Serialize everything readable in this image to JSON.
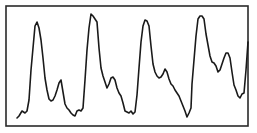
{
  "chart_data": {
    "type": "line",
    "title": "",
    "xlabel": "",
    "ylabel": "",
    "grid": false,
    "legend": null,
    "frame": {
      "x": 6,
      "y": 6,
      "width": 242,
      "height": 120
    },
    "colors": {
      "line": "#1a1a1a",
      "frame": "#2a2a2a",
      "background": "#ffffff"
    },
    "x_pixels": [
      17,
      19,
      22,
      25,
      27,
      29,
      31,
      33,
      35,
      37,
      39,
      41,
      43,
      45,
      47,
      49,
      51,
      53,
      55,
      57,
      59,
      61,
      63,
      65,
      67,
      69,
      71,
      73,
      75,
      77,
      79,
      81,
      83,
      85,
      87,
      89,
      91,
      93,
      95,
      97,
      99,
      101,
      103,
      105,
      107,
      109,
      111,
      113,
      115,
      117,
      119,
      121,
      123,
      125,
      127,
      129,
      131,
      133,
      135,
      137,
      139,
      141,
      143,
      145,
      147,
      149,
      151,
      153,
      155,
      157,
      159,
      161,
      163,
      165,
      167,
      169,
      171,
      173,
      175,
      177,
      179,
      181,
      183,
      185,
      187,
      189,
      191,
      192,
      194,
      196,
      198,
      200,
      202,
      204,
      206,
      208,
      210,
      212,
      214,
      216,
      218,
      220,
      222,
      224,
      226,
      228,
      230,
      232,
      234,
      236,
      238,
      240,
      242,
      244,
      246,
      248
    ],
    "y_pixels": [
      118,
      116,
      111,
      113,
      111,
      100,
      70,
      48,
      26,
      22,
      28,
      40,
      58,
      78,
      90,
      99,
      101,
      100,
      96,
      90,
      83,
      80,
      92,
      104,
      108,
      110,
      113,
      115,
      116,
      111,
      110,
      111,
      108,
      80,
      50,
      28,
      14,
      16,
      19,
      22,
      48,
      68,
      76,
      82,
      88,
      84,
      78,
      77,
      80,
      88,
      93,
      96,
      103,
      111,
      112,
      113,
      111,
      114,
      112,
      95,
      68,
      42,
      26,
      20,
      21,
      26,
      46,
      64,
      72,
      76,
      78,
      77,
      74,
      69,
      72,
      79,
      84,
      86,
      90,
      93,
      96,
      101,
      106,
      111,
      117,
      113,
      108,
      84,
      60,
      36,
      19,
      16,
      16,
      19,
      34,
      45,
      56,
      62,
      63,
      66,
      72,
      70,
      64,
      58,
      53,
      53,
      58,
      72,
      85,
      90,
      96,
      98,
      94,
      93,
      70,
      42
    ],
    "cycles": 4,
    "peaks_pixels": [
      [
        36,
        22
      ],
      [
        91,
        14
      ],
      [
        149,
        20
      ],
      [
        205,
        16
      ]
    ],
    "normalized_values": [
      0.07,
      0.08,
      0.13,
      0.11,
      0.13,
      0.22,
      0.47,
      0.65,
      0.83,
      0.87,
      0.82,
      0.72,
      0.57,
      0.4,
      0.3,
      0.23,
      0.21,
      0.22,
      0.25,
      0.3,
      0.36,
      0.38,
      0.28,
      0.18,
      0.15,
      0.13,
      0.11,
      0.09,
      0.08,
      0.13,
      0.13,
      0.13,
      0.15,
      0.38,
      0.63,
      0.82,
      0.93,
      0.92,
      0.89,
      0.87,
      0.65,
      0.48,
      0.42,
      0.37,
      0.32,
      0.35,
      0.4,
      0.41,
      0.38,
      0.32,
      0.28,
      0.25,
      0.19,
      0.13,
      0.12,
      0.11,
      0.13,
      0.1,
      0.12,
      0.26,
      0.48,
      0.7,
      0.83,
      0.88,
      0.87,
      0.83,
      0.66,
      0.51,
      0.45,
      0.42,
      0.4,
      0.41,
      0.43,
      0.47,
      0.45,
      0.39,
      0.35,
      0.33,
      0.3,
      0.28,
      0.25,
      0.21,
      0.17,
      0.13,
      0.08,
      0.11,
      0.15,
      0.35,
      0.55,
      0.75,
      0.89,
      0.92,
      0.92,
      0.89,
      0.77,
      0.67,
      0.58,
      0.53,
      0.52,
      0.5,
      0.45,
      0.47,
      0.52,
      0.57,
      0.61,
      0.61,
      0.57,
      0.45,
      0.35,
      0.3,
      0.25,
      0.23,
      0.27,
      0.28,
      0.47,
      0.7
    ]
  }
}
